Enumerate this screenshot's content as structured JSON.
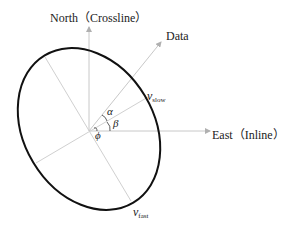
{
  "diagram": {
    "axes": {
      "north_label": "North（Crossline）",
      "east_label": "East（Inline）",
      "data_label": "Data"
    },
    "velocities": {
      "slow": {
        "symbol": "v",
        "subscript": "slow"
      },
      "fast": {
        "symbol": "v",
        "subscript": "fast"
      }
    },
    "angles": {
      "alpha": "α",
      "beta": "β",
      "phi": "ϕ"
    },
    "colors": {
      "ellipse": "#111111",
      "axes": "#c8c8c8"
    }
  }
}
